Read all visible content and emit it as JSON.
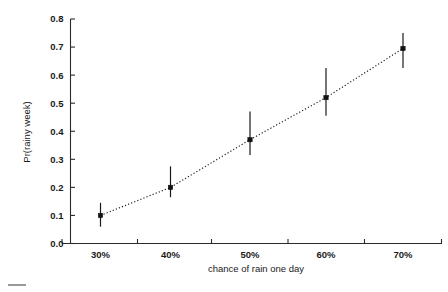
{
  "chart_data": {
    "type": "scatter",
    "title": "",
    "subtitle": "",
    "xlabel": "chance of rain one day",
    "ylabel": "Pr(rainy week)",
    "categories": [
      "30%",
      "40%",
      "50%",
      "60%",
      "70%"
    ],
    "x": [
      30,
      40,
      50,
      60,
      70
    ],
    "values": [
      0.1,
      0.2,
      0.37,
      0.52,
      0.695
    ],
    "error_low": [
      0.06,
      0.165,
      0.315,
      0.455,
      0.625
    ],
    "error_high": [
      0.145,
      0.275,
      0.47,
      0.625,
      0.75
    ],
    "xlim": [
      25,
      75
    ],
    "ylim": [
      0.0,
      0.8
    ],
    "ytick_labels": [
      "0.0",
      "0.1",
      "0.2",
      "0.3",
      "0.4",
      "0.5",
      "0.6",
      "0.7",
      "0.8"
    ],
    "ytick_values": [
      0.0,
      0.1,
      0.2,
      0.3,
      0.4,
      0.5,
      0.6,
      0.7,
      0.8
    ],
    "xtick_labels": [
      "30%",
      "40%",
      "50%",
      "60%",
      "70%"
    ],
    "grid": false,
    "legend": false,
    "legend_position": "none",
    "line_style": "dotted",
    "marker_style": "filled-square",
    "error_bar_style": "vertical-line",
    "series": [
      {
        "name": "Pr(rainy week)",
        "values": [
          0.1,
          0.2,
          0.37,
          0.52,
          0.695
        ]
      }
    ],
    "annotations": []
  },
  "axes": {
    "y_axis_name": "y-axis",
    "x_axis_name": "x-axis"
  },
  "colors": {
    "background": "#ffffff",
    "axis": "#2b2b2b",
    "marker": "#111111",
    "line": "#1a1a1a",
    "text": "#1a1a1a"
  }
}
